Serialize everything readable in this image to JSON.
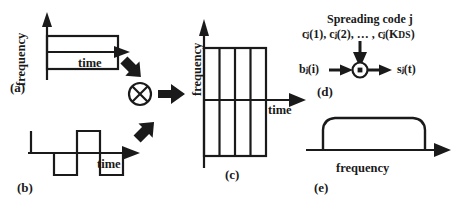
{
  "figure": {
    "stroke_color": "#1a1a1a",
    "background_color": "#ffffff"
  },
  "panels": {
    "a": {
      "id": "(a)",
      "y_axis_label": "frequency",
      "x_axis_label": "time",
      "shape": "narrow-wide-rectangle",
      "meaning": "narrowband data signal"
    },
    "b": {
      "id": "(b)",
      "x_axis_label": "time",
      "shape": "square-wave",
      "meaning": "spreading code waveform"
    },
    "c": {
      "id": "(c)",
      "y_axis_label": "frequency",
      "x_axis_label": "time",
      "shape": "tall-rectangle-with-vertical-grid-lines",
      "grid_line_count": 3,
      "meaning": "spread wideband signal"
    },
    "d": {
      "id": "(d)",
      "code_title": "Spreading code j",
      "code_sequence_prefix": "c",
      "code_sequence": "cⱼ(1), cⱼ(2), … , cⱼ(K",
      "code_sequence_tail": "DS",
      "code_sequence_end": ")",
      "input_label": "bⱼ(i)",
      "output_label": "sⱼ(t)",
      "operator_symbol": "multiplier-dot",
      "meaning": "multiplier block diagram"
    },
    "e": {
      "id": "(e)",
      "x_axis_label": "frequency",
      "shape": "flat-top-spectrum",
      "meaning": "resulting wideband power spectrum"
    }
  },
  "operators": {
    "cross_multiply": {
      "symbol": "⊗",
      "name": "circled-times"
    },
    "arrow_down_right": "thick-arrow-down-right",
    "arrow_up_right": "thick-arrow-up-right",
    "arrow_right": "thick-block-arrow-right"
  }
}
